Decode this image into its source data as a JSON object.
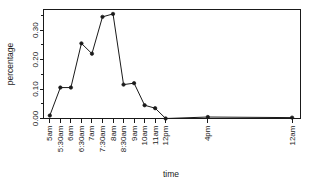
{
  "chart_data": {
    "type": "line",
    "title": "",
    "subtitle": "",
    "xlabel": "time",
    "ylabel": "percentage",
    "categories": [
      "5am",
      "5:30am",
      "6am",
      "6:30am",
      "7am",
      "7:30am",
      "8am",
      "8:30am",
      "9am",
      "10am",
      "11am",
      "12pm",
      "4pm",
      "12am"
    ],
    "values": [
      0.01,
      0.105,
      0.105,
      0.255,
      0.22,
      0.345,
      0.355,
      0.115,
      0.12,
      0.045,
      0.035,
      0.0,
      0.005,
      0.003
    ],
    "series": [
      {
        "name": "percentage",
        "values": [
          0.01,
          0.105,
          0.105,
          0.255,
          0.22,
          0.345,
          0.355,
          0.115,
          0.12,
          0.045,
          0.035,
          0.0,
          0.005,
          0.003
        ]
      }
    ],
    "x_positions": [
      1,
      2,
      3,
      4,
      5,
      6,
      7,
      8,
      9,
      10,
      11,
      12,
      16,
      24
    ],
    "xlim": [
      0.4,
      24.8
    ],
    "ylim": [
      0.0,
      0.37
    ],
    "y_ticks": [
      0.0,
      0.1,
      0.2,
      0.3
    ],
    "y_tick_labels": [
      "0.00",
      "0.10",
      "0.20",
      "0.30"
    ],
    "y_minor_ticks": [
      0.05,
      0.15,
      0.25,
      0.35
    ],
    "grid": false,
    "legend": false,
    "legend_position": "none",
    "marker": "filled-circle",
    "line_color": "#1a1a1a",
    "marker_color": "#1a1a1a",
    "background_color": "#ffffff",
    "x_tick_label_rotation": 90,
    "y_tick_label_rotation": 90,
    "annotations": []
  },
  "axes": {
    "x_title": "time",
    "y_title": "percentage"
  }
}
